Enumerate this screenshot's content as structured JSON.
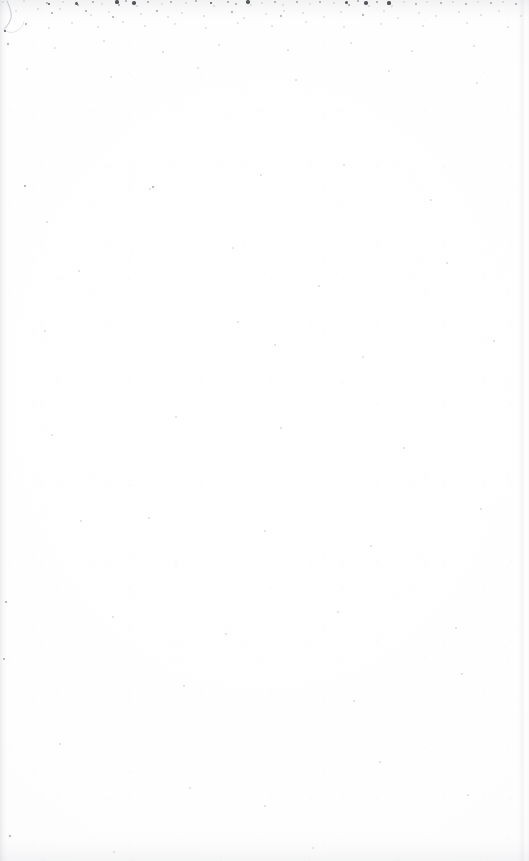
{
  "page": {
    "kind": "scanned-page",
    "content_type": "blank",
    "width": 529,
    "height": 861,
    "visible_text": "",
    "has_text": false,
    "has_page_number": false,
    "has_illustration": false
  },
  "colors": {
    "paper": "#ffffff",
    "paper_tint": "#fdfdfe",
    "speck_dark": "#4a4d52",
    "speck_mid": "#7d8187",
    "speck_light": "#b8bbc1",
    "edge_shadow": "#b6b8be",
    "stroke": "#b9bcc2"
  },
  "artifacts": {
    "corner_stroke": {
      "name": "pen-stroke-arc",
      "location": "top-left",
      "path_main": "M 7 1 C 10 8, 13 15, 10 21 C 8.2 25, 5.4 27, 4.2 30",
      "path_faint": "M 4.2 30 C 7 32.5, 12 33.2, 16 31.4 C 20.5 29.4, 23 26, 24 22"
    },
    "speck_band_top": {
      "name": "scanner-dust-band",
      "y_range": [
        0,
        28
      ],
      "density": "high"
    },
    "specks": [
      {
        "x": 3,
        "y": 2,
        "r": 1.0,
        "tone": "light"
      },
      {
        "x": 24,
        "y": 1,
        "r": 0.9,
        "tone": "light"
      },
      {
        "x": 47,
        "y": 3,
        "r": 1.3,
        "tone": "mid"
      },
      {
        "x": 49,
        "y": 4,
        "r": 1.0,
        "tone": "dark"
      },
      {
        "x": 63,
        "y": 2,
        "r": 0.8,
        "tone": "light"
      },
      {
        "x": 76,
        "y": 3,
        "r": 1.5,
        "tone": "dark"
      },
      {
        "x": 78,
        "y": 5,
        "r": 0.9,
        "tone": "mid"
      },
      {
        "x": 93,
        "y": 2,
        "r": 1.1,
        "tone": "mid"
      },
      {
        "x": 102,
        "y": 4,
        "r": 0.8,
        "tone": "light"
      },
      {
        "x": 117,
        "y": 2,
        "r": 1.6,
        "tone": "dark"
      },
      {
        "x": 119,
        "y": 5,
        "r": 0.9,
        "tone": "mid"
      },
      {
        "x": 126,
        "y": 1,
        "r": 1.0,
        "tone": "mid"
      },
      {
        "x": 134,
        "y": 3,
        "r": 1.8,
        "tone": "dark"
      },
      {
        "x": 137,
        "y": 6,
        "r": 0.8,
        "tone": "light"
      },
      {
        "x": 148,
        "y": 2,
        "r": 1.0,
        "tone": "mid"
      },
      {
        "x": 162,
        "y": 4,
        "r": 0.9,
        "tone": "light"
      },
      {
        "x": 171,
        "y": 2,
        "r": 1.2,
        "tone": "mid"
      },
      {
        "x": 186,
        "y": 3,
        "r": 0.8,
        "tone": "light"
      },
      {
        "x": 196,
        "y": 1,
        "r": 1.0,
        "tone": "mid"
      },
      {
        "x": 211,
        "y": 3,
        "r": 1.4,
        "tone": "dark"
      },
      {
        "x": 214,
        "y": 6,
        "r": 0.8,
        "tone": "light"
      },
      {
        "x": 228,
        "y": 2,
        "r": 0.9,
        "tone": "mid"
      },
      {
        "x": 236,
        "y": 4,
        "r": 1.1,
        "tone": "mid"
      },
      {
        "x": 248,
        "y": 2,
        "r": 1.7,
        "tone": "dark"
      },
      {
        "x": 251,
        "y": 5,
        "r": 0.9,
        "tone": "light"
      },
      {
        "x": 262,
        "y": 3,
        "r": 0.8,
        "tone": "light"
      },
      {
        "x": 275,
        "y": 2,
        "r": 1.0,
        "tone": "mid"
      },
      {
        "x": 283,
        "y": 5,
        "r": 0.8,
        "tone": "light"
      },
      {
        "x": 297,
        "y": 2,
        "r": 1.2,
        "tone": "mid"
      },
      {
        "x": 310,
        "y": 4,
        "r": 0.9,
        "tone": "light"
      },
      {
        "x": 320,
        "y": 2,
        "r": 1.0,
        "tone": "mid"
      },
      {
        "x": 334,
        "y": 3,
        "r": 0.8,
        "tone": "light"
      },
      {
        "x": 346,
        "y": 2,
        "r": 1.5,
        "tone": "dark"
      },
      {
        "x": 349,
        "y": 5,
        "r": 0.9,
        "tone": "mid"
      },
      {
        "x": 358,
        "y": 1,
        "r": 1.0,
        "tone": "mid"
      },
      {
        "x": 366,
        "y": 3,
        "r": 1.8,
        "tone": "dark"
      },
      {
        "x": 369,
        "y": 6,
        "r": 0.8,
        "tone": "light"
      },
      {
        "x": 377,
        "y": 2,
        "r": 1.0,
        "tone": "mid"
      },
      {
        "x": 389,
        "y": 3,
        "r": 1.6,
        "tone": "dark"
      },
      {
        "x": 392,
        "y": 6,
        "r": 0.9,
        "tone": "light"
      },
      {
        "x": 404,
        "y": 2,
        "r": 0.8,
        "tone": "light"
      },
      {
        "x": 416,
        "y": 4,
        "r": 1.0,
        "tone": "mid"
      },
      {
        "x": 427,
        "y": 2,
        "r": 0.9,
        "tone": "light"
      },
      {
        "x": 441,
        "y": 3,
        "r": 1.1,
        "tone": "mid"
      },
      {
        "x": 453,
        "y": 2,
        "r": 0.8,
        "tone": "light"
      },
      {
        "x": 466,
        "y": 4,
        "r": 1.0,
        "tone": "mid"
      },
      {
        "x": 478,
        "y": 2,
        "r": 0.9,
        "tone": "light"
      },
      {
        "x": 491,
        "y": 3,
        "r": 1.2,
        "tone": "mid"
      },
      {
        "x": 503,
        "y": 2,
        "r": 0.8,
        "tone": "light"
      },
      {
        "x": 516,
        "y": 4,
        "r": 1.0,
        "tone": "mid"
      },
      {
        "x": 16,
        "y": 11,
        "r": 0.9,
        "tone": "light"
      },
      {
        "x": 38,
        "y": 9,
        "r": 0.8,
        "tone": "light"
      },
      {
        "x": 52,
        "y": 13,
        "r": 1.0,
        "tone": "mid"
      },
      {
        "x": 60,
        "y": 9,
        "r": 0.8,
        "tone": "light"
      },
      {
        "x": 86,
        "y": 11,
        "r": 1.0,
        "tone": "mid"
      },
      {
        "x": 91,
        "y": 15,
        "r": 0.8,
        "tone": "light"
      },
      {
        "x": 109,
        "y": 12,
        "r": 0.9,
        "tone": "light"
      },
      {
        "x": 113,
        "y": 17,
        "r": 1.0,
        "tone": "mid"
      },
      {
        "x": 141,
        "y": 14,
        "r": 0.8,
        "tone": "light"
      },
      {
        "x": 157,
        "y": 11,
        "r": 0.9,
        "tone": "mid"
      },
      {
        "x": 168,
        "y": 17,
        "r": 0.8,
        "tone": "light"
      },
      {
        "x": 182,
        "y": 13,
        "r": 0.9,
        "tone": "light"
      },
      {
        "x": 204,
        "y": 16,
        "r": 0.8,
        "tone": "light"
      },
      {
        "x": 232,
        "y": 12,
        "r": 0.9,
        "tone": "mid"
      },
      {
        "x": 244,
        "y": 18,
        "r": 0.8,
        "tone": "light"
      },
      {
        "x": 266,
        "y": 14,
        "r": 0.9,
        "tone": "light"
      },
      {
        "x": 281,
        "y": 16,
        "r": 1.1,
        "tone": "mid"
      },
      {
        "x": 284,
        "y": 11,
        "r": 0.8,
        "tone": "light"
      },
      {
        "x": 303,
        "y": 13,
        "r": 0.8,
        "tone": "light"
      },
      {
        "x": 324,
        "y": 17,
        "r": 0.9,
        "tone": "light"
      },
      {
        "x": 341,
        "y": 12,
        "r": 0.8,
        "tone": "light"
      },
      {
        "x": 363,
        "y": 15,
        "r": 0.9,
        "tone": "mid"
      },
      {
        "x": 384,
        "y": 11,
        "r": 0.8,
        "tone": "light"
      },
      {
        "x": 398,
        "y": 18,
        "r": 0.9,
        "tone": "light"
      },
      {
        "x": 419,
        "y": 13,
        "r": 0.8,
        "tone": "light"
      },
      {
        "x": 436,
        "y": 16,
        "r": 0.9,
        "tone": "light"
      },
      {
        "x": 459,
        "y": 12,
        "r": 0.8,
        "tone": "light"
      },
      {
        "x": 481,
        "y": 15,
        "r": 0.9,
        "tone": "light"
      },
      {
        "x": 499,
        "y": 11,
        "r": 0.8,
        "tone": "light"
      },
      {
        "x": 521,
        "y": 16,
        "r": 0.9,
        "tone": "light"
      },
      {
        "x": 5,
        "y": 31,
        "r": 1.4,
        "tone": "dark"
      },
      {
        "x": 26,
        "y": 24,
        "r": 0.9,
        "tone": "mid"
      },
      {
        "x": 49,
        "y": 28,
        "r": 0.8,
        "tone": "light"
      },
      {
        "x": 72,
        "y": 23,
        "r": 0.9,
        "tone": "light"
      },
      {
        "x": 98,
        "y": 27,
        "r": 0.8,
        "tone": "light"
      },
      {
        "x": 123,
        "y": 22,
        "r": 0.9,
        "tone": "light"
      },
      {
        "x": 145,
        "y": 26,
        "r": 0.8,
        "tone": "light"
      },
      {
        "x": 175,
        "y": 24,
        "r": 0.9,
        "tone": "light"
      },
      {
        "x": 206,
        "y": 28,
        "r": 0.8,
        "tone": "light"
      },
      {
        "x": 238,
        "y": 23,
        "r": 0.9,
        "tone": "light"
      },
      {
        "x": 272,
        "y": 26,
        "r": 0.8,
        "tone": "light"
      },
      {
        "x": 306,
        "y": 22,
        "r": 0.9,
        "tone": "light"
      },
      {
        "x": 344,
        "y": 27,
        "r": 0.8,
        "tone": "light"
      },
      {
        "x": 381,
        "y": 24,
        "r": 0.9,
        "tone": "light"
      },
      {
        "x": 423,
        "y": 26,
        "r": 0.8,
        "tone": "light"
      },
      {
        "x": 467,
        "y": 23,
        "r": 0.9,
        "tone": "light"
      },
      {
        "x": 508,
        "y": 27,
        "r": 0.8,
        "tone": "light"
      },
      {
        "x": 8,
        "y": 44,
        "r": 1.2,
        "tone": "mid"
      },
      {
        "x": 55,
        "y": 48,
        "r": 0.8,
        "tone": "light"
      },
      {
        "x": 104,
        "y": 41,
        "r": 0.8,
        "tone": "light"
      },
      {
        "x": 163,
        "y": 52,
        "r": 0.8,
        "tone": "light"
      },
      {
        "x": 219,
        "y": 45,
        "r": 0.8,
        "tone": "light"
      },
      {
        "x": 288,
        "y": 50,
        "r": 0.8,
        "tone": "light"
      },
      {
        "x": 351,
        "y": 43,
        "r": 0.8,
        "tone": "light"
      },
      {
        "x": 412,
        "y": 51,
        "r": 0.8,
        "tone": "light"
      },
      {
        "x": 474,
        "y": 46,
        "r": 0.8,
        "tone": "light"
      },
      {
        "x": 27,
        "y": 69,
        "r": 0.8,
        "tone": "light"
      },
      {
        "x": 111,
        "y": 77,
        "r": 0.8,
        "tone": "light"
      },
      {
        "x": 198,
        "y": 68,
        "r": 0.8,
        "tone": "light"
      },
      {
        "x": 296,
        "y": 80,
        "r": 0.8,
        "tone": "light"
      },
      {
        "x": 389,
        "y": 71,
        "r": 0.8,
        "tone": "light"
      },
      {
        "x": 477,
        "y": 83,
        "r": 0.8,
        "tone": "light"
      },
      {
        "x": 25,
        "y": 186,
        "r": 1.3,
        "tone": "mid"
      },
      {
        "x": 150,
        "y": 189,
        "r": 0.9,
        "tone": "light"
      },
      {
        "x": 153,
        "y": 187,
        "r": 1.1,
        "tone": "mid"
      },
      {
        "x": 261,
        "y": 175,
        "r": 0.8,
        "tone": "light"
      },
      {
        "x": 344,
        "y": 165,
        "r": 0.8,
        "tone": "light"
      },
      {
        "x": 431,
        "y": 200,
        "r": 0.8,
        "tone": "light"
      },
      {
        "x": 47,
        "y": 222,
        "r": 0.8,
        "tone": "light"
      },
      {
        "x": 79,
        "y": 271,
        "r": 0.8,
        "tone": "light"
      },
      {
        "x": 233,
        "y": 248,
        "r": 0.8,
        "tone": "light"
      },
      {
        "x": 319,
        "y": 286,
        "r": 0.8,
        "tone": "light"
      },
      {
        "x": 447,
        "y": 263,
        "r": 0.8,
        "tone": "light"
      },
      {
        "x": 45,
        "y": 331,
        "r": 0.8,
        "tone": "light"
      },
      {
        "x": 238,
        "y": 322,
        "r": 0.8,
        "tone": "light"
      },
      {
        "x": 275,
        "y": 345,
        "r": 0.8,
        "tone": "light"
      },
      {
        "x": 363,
        "y": 357,
        "r": 0.8,
        "tone": "light"
      },
      {
        "x": 494,
        "y": 341,
        "r": 0.8,
        "tone": "light"
      },
      {
        "x": 52,
        "y": 435,
        "r": 0.9,
        "tone": "light"
      },
      {
        "x": 176,
        "y": 417,
        "r": 0.8,
        "tone": "light"
      },
      {
        "x": 281,
        "y": 428,
        "r": 0.8,
        "tone": "light"
      },
      {
        "x": 404,
        "y": 448,
        "r": 0.8,
        "tone": "light"
      },
      {
        "x": 81,
        "y": 521,
        "r": 0.8,
        "tone": "light"
      },
      {
        "x": 149,
        "y": 518,
        "r": 0.9,
        "tone": "light"
      },
      {
        "x": 265,
        "y": 531,
        "r": 0.8,
        "tone": "light"
      },
      {
        "x": 371,
        "y": 546,
        "r": 0.8,
        "tone": "light"
      },
      {
        "x": 481,
        "y": 509,
        "r": 0.8,
        "tone": "light"
      },
      {
        "x": 6,
        "y": 602,
        "r": 0.9,
        "tone": "mid"
      },
      {
        "x": 113,
        "y": 617,
        "r": 0.8,
        "tone": "light"
      },
      {
        "x": 226,
        "y": 634,
        "r": 0.8,
        "tone": "light"
      },
      {
        "x": 338,
        "y": 612,
        "r": 0.8,
        "tone": "light"
      },
      {
        "x": 456,
        "y": 628,
        "r": 0.8,
        "tone": "light"
      },
      {
        "x": 4,
        "y": 659,
        "r": 1.2,
        "tone": "mid"
      },
      {
        "x": 184,
        "y": 686,
        "r": 0.8,
        "tone": "light"
      },
      {
        "x": 354,
        "y": 701,
        "r": 0.8,
        "tone": "light"
      },
      {
        "x": 462,
        "y": 674,
        "r": 0.8,
        "tone": "light"
      },
      {
        "x": 60,
        "y": 744,
        "r": 0.8,
        "tone": "light"
      },
      {
        "x": 190,
        "y": 788,
        "r": 0.8,
        "tone": "light"
      },
      {
        "x": 265,
        "y": 806,
        "r": 0.8,
        "tone": "light"
      },
      {
        "x": 380,
        "y": 762,
        "r": 0.8,
        "tone": "light"
      },
      {
        "x": 468,
        "y": 795,
        "r": 0.8,
        "tone": "light"
      },
      {
        "x": 10,
        "y": 836,
        "r": 1.0,
        "tone": "mid"
      },
      {
        "x": 114,
        "y": 852,
        "r": 0.8,
        "tone": "light"
      },
      {
        "x": 313,
        "y": 848,
        "r": 0.8,
        "tone": "light"
      }
    ]
  }
}
